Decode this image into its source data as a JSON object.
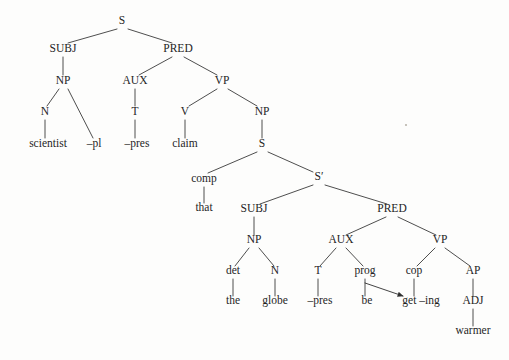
{
  "figure": {
    "sentence": "scientist -pl -pres claim that the globe -pres be get -ing warmer",
    "background_color": "#fdfdfc",
    "line_color": "#3a3a3a",
    "text_color": "#242424"
  },
  "nodes": [
    {
      "id": "n0",
      "label": "S",
      "kind": "category",
      "x": 122,
      "y": 24
    },
    {
      "id": "n1",
      "label": "SUBJ",
      "kind": "category",
      "x": 63,
      "y": 52
    },
    {
      "id": "n2",
      "label": "PRED",
      "kind": "category",
      "x": 178,
      "y": 52
    },
    {
      "id": "n3",
      "label": "NP",
      "kind": "category",
      "x": 63,
      "y": 84
    },
    {
      "id": "n4",
      "label": "N",
      "kind": "category",
      "x": 45,
      "y": 115
    },
    {
      "id": "n5",
      "label": "scientist",
      "kind": "terminal",
      "x": 48,
      "y": 147
    },
    {
      "id": "n6",
      "label": "–pl",
      "kind": "terminal",
      "x": 94,
      "y": 147
    },
    {
      "id": "n7",
      "label": "AUX",
      "kind": "category",
      "x": 135,
      "y": 84
    },
    {
      "id": "n8",
      "label": "T",
      "kind": "category",
      "x": 135,
      "y": 115
    },
    {
      "id": "n9",
      "label": "–pres",
      "kind": "terminal",
      "x": 137,
      "y": 147
    },
    {
      "id": "n10",
      "label": "VP",
      "kind": "category",
      "x": 222,
      "y": 84
    },
    {
      "id": "n11",
      "label": "V",
      "kind": "category",
      "x": 185,
      "y": 115
    },
    {
      "id": "n12",
      "label": "claim",
      "kind": "terminal",
      "x": 185,
      "y": 147
    },
    {
      "id": "n13",
      "label": "NP",
      "kind": "category",
      "x": 262,
      "y": 115
    },
    {
      "id": "n14",
      "label": "S",
      "kind": "category",
      "x": 262,
      "y": 147
    },
    {
      "id": "n15",
      "label": "comp",
      "kind": "category",
      "x": 204,
      "y": 182
    },
    {
      "id": "n16",
      "label": "that",
      "kind": "terminal",
      "x": 204,
      "y": 211
    },
    {
      "id": "n17",
      "label": "S′",
      "kind": "category",
      "x": 319,
      "y": 180
    },
    {
      "id": "n18",
      "label": "SUBJ",
      "kind": "category",
      "x": 254,
      "y": 212
    },
    {
      "id": "n19",
      "label": "NP",
      "kind": "category",
      "x": 254,
      "y": 243
    },
    {
      "id": "n20",
      "label": "det",
      "kind": "category",
      "x": 233,
      "y": 274
    },
    {
      "id": "n21",
      "label": "the",
      "kind": "terminal",
      "x": 233,
      "y": 304
    },
    {
      "id": "n22",
      "label": "N",
      "kind": "category",
      "x": 275,
      "y": 274
    },
    {
      "id": "n23",
      "label": "globe",
      "kind": "terminal",
      "x": 275,
      "y": 304
    },
    {
      "id": "n24",
      "label": "PRED",
      "kind": "category",
      "x": 392,
      "y": 212
    },
    {
      "id": "n25",
      "label": "AUX",
      "kind": "category",
      "x": 341,
      "y": 243
    },
    {
      "id": "n26",
      "label": "T",
      "kind": "category",
      "x": 318,
      "y": 274
    },
    {
      "id": "n27",
      "label": "–pres",
      "kind": "terminal",
      "x": 320,
      "y": 304
    },
    {
      "id": "n28",
      "label": "prog",
      "kind": "category",
      "x": 365,
      "y": 274
    },
    {
      "id": "n29",
      "label": "be",
      "kind": "terminal",
      "x": 367,
      "y": 304
    },
    {
      "id": "n30",
      "label": "VP",
      "kind": "category",
      "x": 440,
      "y": 243
    },
    {
      "id": "n31",
      "label": "cop",
      "kind": "category",
      "x": 414,
      "y": 274
    },
    {
      "id": "n32",
      "label": "get –ing",
      "kind": "terminal",
      "x": 421,
      "y": 304
    },
    {
      "id": "n33",
      "label": "AP",
      "kind": "category",
      "x": 473,
      "y": 274
    },
    {
      "id": "n34",
      "label": "ADJ",
      "kind": "category",
      "x": 473,
      "y": 304
    },
    {
      "id": "n35",
      "label": "warmer",
      "kind": "terminal",
      "x": 473,
      "y": 334
    }
  ],
  "edges": [
    {
      "from": "n0",
      "to": "n1",
      "x1": 117,
      "y1": 29,
      "x2": 68,
      "y2": 43
    },
    {
      "from": "n0",
      "to": "n2",
      "x1": 128,
      "y1": 29,
      "x2": 172,
      "y2": 43
    },
    {
      "from": "n1",
      "to": "n3",
      "x1": 63,
      "y1": 57,
      "x2": 63,
      "y2": 75
    },
    {
      "from": "n3",
      "to": "n4",
      "x1": 59,
      "y1": 89,
      "x2": 47,
      "y2": 106
    },
    {
      "from": "n3",
      "to": "n6",
      "x1": 68,
      "y1": 89,
      "x2": 93,
      "y2": 138
    },
    {
      "from": "n4",
      "to": "n5",
      "x1": 45,
      "y1": 120,
      "x2": 45,
      "y2": 138
    },
    {
      "from": "n2",
      "to": "n7",
      "x1": 172,
      "y1": 57,
      "x2": 139,
      "y2": 75
    },
    {
      "from": "n2",
      "to": "n10",
      "x1": 184,
      "y1": 57,
      "x2": 217,
      "y2": 75
    },
    {
      "from": "n7",
      "to": "n8",
      "x1": 135,
      "y1": 89,
      "x2": 135,
      "y2": 106
    },
    {
      "from": "n8",
      "to": "n9",
      "x1": 135,
      "y1": 120,
      "x2": 135,
      "y2": 138
    },
    {
      "from": "n10",
      "to": "n11",
      "x1": 217,
      "y1": 89,
      "x2": 189,
      "y2": 106
    },
    {
      "from": "n10",
      "to": "n13",
      "x1": 228,
      "y1": 89,
      "x2": 257,
      "y2": 106
    },
    {
      "from": "n11",
      "to": "n12",
      "x1": 185,
      "y1": 120,
      "x2": 185,
      "y2": 138
    },
    {
      "from": "n13",
      "to": "n14",
      "x1": 262,
      "y1": 120,
      "x2": 262,
      "y2": 138
    },
    {
      "from": "n14",
      "to": "n15",
      "x1": 257,
      "y1": 152,
      "x2": 208,
      "y2": 173
    },
    {
      "from": "n14",
      "to": "n17",
      "x1": 268,
      "y1": 152,
      "x2": 313,
      "y2": 172
    },
    {
      "from": "n15",
      "to": "n16",
      "x1": 204,
      "y1": 187,
      "x2": 204,
      "y2": 203
    },
    {
      "from": "n17",
      "to": "n18",
      "x1": 313,
      "y1": 185,
      "x2": 260,
      "y2": 204
    },
    {
      "from": "n17",
      "to": "n24",
      "x1": 325,
      "y1": 185,
      "x2": 387,
      "y2": 204
    },
    {
      "from": "n18",
      "to": "n19",
      "x1": 254,
      "y1": 217,
      "x2": 254,
      "y2": 235
    },
    {
      "from": "n19",
      "to": "n20",
      "x1": 249,
      "y1": 248,
      "x2": 235,
      "y2": 266
    },
    {
      "from": "n19",
      "to": "n22",
      "x1": 259,
      "y1": 248,
      "x2": 274,
      "y2": 266
    },
    {
      "from": "n20",
      "to": "n21",
      "x1": 233,
      "y1": 279,
      "x2": 233,
      "y2": 296
    },
    {
      "from": "n22",
      "to": "n23",
      "x1": 275,
      "y1": 279,
      "x2": 275,
      "y2": 296
    },
    {
      "from": "n24",
      "to": "n25",
      "x1": 386,
      "y1": 217,
      "x2": 346,
      "y2": 235
    },
    {
      "from": "n24",
      "to": "n30",
      "x1": 398,
      "y1": 217,
      "x2": 436,
      "y2": 235
    },
    {
      "from": "n25",
      "to": "n26",
      "x1": 336,
      "y1": 248,
      "x2": 320,
      "y2": 266
    },
    {
      "from": "n25",
      "to": "n28",
      "x1": 346,
      "y1": 248,
      "x2": 363,
      "y2": 266
    },
    {
      "from": "n26",
      "to": "n27",
      "x1": 318,
      "y1": 279,
      "x2": 318,
      "y2": 296
    },
    {
      "from": "n28",
      "to": "n29",
      "x1": 365,
      "y1": 279,
      "x2": 365,
      "y2": 296
    },
    {
      "from": "n30",
      "to": "n31",
      "x1": 435,
      "y1": 248,
      "x2": 417,
      "y2": 266
    },
    {
      "from": "n30",
      "to": "n33",
      "x1": 445,
      "y1": 248,
      "x2": 470,
      "y2": 266
    },
    {
      "from": "n31",
      "to": "n32",
      "x1": 414,
      "y1": 279,
      "x2": 414,
      "y2": 296
    },
    {
      "from": "n33",
      "to": "n34",
      "x1": 473,
      "y1": 279,
      "x2": 473,
      "y2": 296
    },
    {
      "from": "n34",
      "to": "n35",
      "x1": 473,
      "y1": 309,
      "x2": 473,
      "y2": 326
    }
  ],
  "movement_arrow": {
    "label": "prog-to-get-movement",
    "from_node": "n28",
    "to_node": "n32",
    "x1": 365,
    "y1": 283,
    "x2": 403,
    "y2": 296
  },
  "speck": {
    "x": 406,
    "y": 125,
    "r": 1.1
  }
}
